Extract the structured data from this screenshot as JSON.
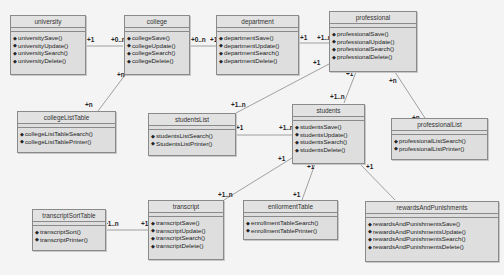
{
  "diagram": {
    "type": "UML class diagram",
    "classes": [
      {
        "name": "university",
        "operations": [
          "universitySave()",
          "universityUpdate()",
          "universitySearch()",
          "universityDelete()"
        ]
      },
      {
        "name": "college",
        "operations": [
          "collegeSave()",
          "collegeUpdate()",
          "collegeSearch()",
          "collegeDelete()"
        ]
      },
      {
        "name": "department",
        "operations": [
          "departmentSave()",
          "departmentUpdate()",
          "departmentSearch()",
          "departmentDelete()"
        ]
      },
      {
        "name": "professional",
        "operations": [
          "professionalSave()",
          "professionalUpdate()",
          "professionalSearch()",
          "professionalDelete()"
        ]
      },
      {
        "name": "collegeListTable",
        "operations": [
          "collegeListTableSearch()",
          "collegeListTablePrinter()"
        ]
      },
      {
        "name": "studentsList",
        "operations": [
          "studentsListSearch()",
          "StudentsListPrinter()"
        ]
      },
      {
        "name": "students",
        "operations": [
          "studentsSave()",
          "studentsUpdate()",
          "studentsSearch()",
          "studentsDelete()"
        ]
      },
      {
        "name": "professionalList",
        "operations": [
          "professionalListSearch()",
          "professionalListPrinter()"
        ]
      },
      {
        "name": "transcriptSortTable",
        "operations": [
          "transcriptSort()",
          "transcriptPrinter()"
        ]
      },
      {
        "name": "transcript",
        "operations": [
          "transcriptSave()",
          "transcriptUpdate()",
          "transcriptSearch()",
          "transcriptDelete()"
        ]
      },
      {
        "name": "enllormentTable",
        "operations": [
          "enrollmentTableSearch()",
          "enrollmentTablePrinter()"
        ]
      },
      {
        "name": "rewardsAndPunishments",
        "operations": [
          "rewardsAndPunishmentsSave()",
          "rewardsAndPunishmentsUpdate()",
          "rewardsAndPunishmentsSearch()",
          "rewardsAndPunishmentsDelete()"
        ]
      }
    ],
    "associations": [
      {
        "from": "university",
        "to": "college",
        "from_mult": "+1",
        "to_mult": "+0..n"
      },
      {
        "from": "college",
        "to": "department",
        "from_mult": "+0..n",
        "to_mult": "+1"
      },
      {
        "from": "department",
        "to": "professional",
        "from_mult": "+1",
        "to_mult": "+1..n"
      },
      {
        "from": "college",
        "to": "collegeListTable",
        "from_mult": "+n",
        "to_mult": "+n"
      },
      {
        "from": "professional",
        "to": "studentsList",
        "from_mult": "+1",
        "to_mult": "+1..n"
      },
      {
        "from": "professional",
        "to": "students",
        "from_mult": "+1",
        "to_mult": "+1..n"
      },
      {
        "from": "professional",
        "to": "professionalList",
        "from_mult": "+n",
        "to_mult": "+n"
      },
      {
        "from": "studentsList",
        "to": "students",
        "from_mult": "+1",
        "to_mult": "+1..n"
      },
      {
        "from": "students",
        "to": "transcript",
        "from_mult": "+1",
        "to_mult": "+1..n"
      },
      {
        "from": "students",
        "to": "enllormentTable",
        "from_mult": "+1",
        "to_mult": "+1"
      },
      {
        "from": "students",
        "to": "rewardsAndPunishments",
        "from_mult": "+1",
        "to_mult": "+0..n"
      },
      {
        "from": "transcript",
        "to": "transcriptSortTable",
        "from_mult": "+1",
        "to_mult": "+1..n"
      }
    ]
  },
  "colors": {
    "background": "#f4f4f4",
    "class_fill": "#dedede",
    "border": "#8a8a8a",
    "line": "#8a8a8a"
  }
}
